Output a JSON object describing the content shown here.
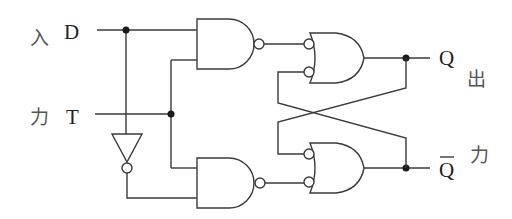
{
  "diagram": {
    "type": "logic-circuit",
    "colors": {
      "line": "#3a3a3a",
      "junction": "#1a1a1a",
      "background": "#ffffff"
    },
    "input_side_labels": {
      "top": "入",
      "bottom": "力"
    },
    "output_side_labels": {
      "top": "出",
      "bottom": "力"
    },
    "signals": {
      "d": "D",
      "t": "T",
      "q": "Q",
      "q_bar": "Q"
    },
    "components": [
      {
        "id": "inverter",
        "type": "NOT"
      },
      {
        "id": "nand-top",
        "type": "NAND",
        "inputs": [
          "D",
          "T"
        ]
      },
      {
        "id": "nand-bottom",
        "type": "NAND",
        "inputs": [
          "T",
          "NOT D"
        ]
      },
      {
        "id": "or-top",
        "type": "OR (inverted inputs)",
        "output": "Q"
      },
      {
        "id": "or-bottom",
        "type": "OR (inverted inputs)",
        "output": "Q-bar"
      }
    ]
  }
}
